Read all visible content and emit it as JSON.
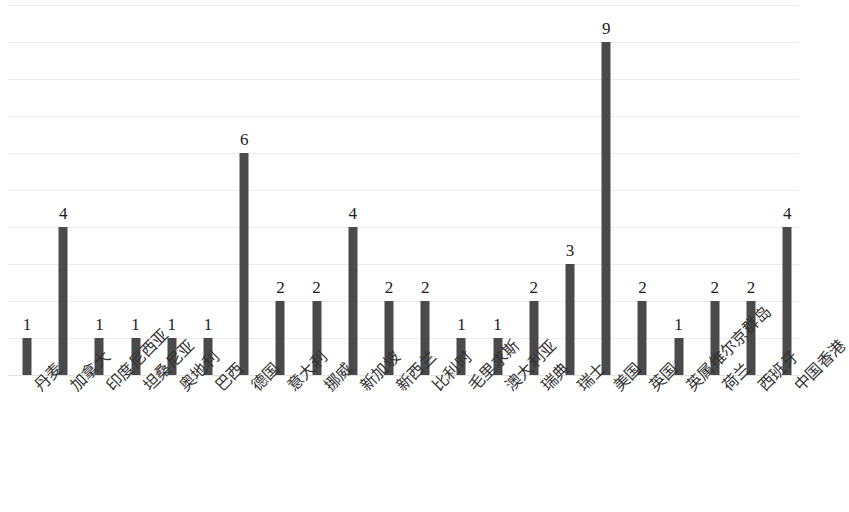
{
  "chart_data": {
    "type": "bar",
    "title": "",
    "subtitle": "",
    "xlabel": "",
    "ylabel": "",
    "ylim": [
      0,
      10
    ],
    "grid": true,
    "gridlines": [
      0,
      1,
      2,
      3,
      4,
      5,
      6,
      7,
      8,
      9,
      10
    ],
    "legend": null,
    "legend_position": "none",
    "axis_tick_labels_y": [],
    "bar_color": "#4a4a4a",
    "gridline_color": "#ececec",
    "data_labels_shown": true,
    "categories": [
      "丹麦",
      "加拿大",
      "印度尼西亚",
      "坦桑尼亚",
      "奥地利",
      "巴西",
      "德国",
      "意大利",
      "挪威",
      "新加坡",
      "新西兰",
      "比利时",
      "毛里求斯",
      "澳大利亚",
      "瑞典",
      "瑞士",
      "美国",
      "英国",
      "英属维尔京群岛",
      "荷兰",
      "西班牙",
      "中国香港"
    ],
    "values": [
      1,
      4,
      1,
      1,
      1,
      1,
      6,
      2,
      2,
      4,
      2,
      2,
      1,
      1,
      2,
      3,
      9,
      2,
      1,
      2,
      2,
      4
    ]
  }
}
